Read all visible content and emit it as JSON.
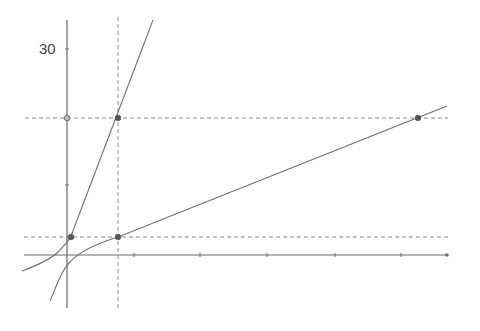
{
  "figure": {
    "y_tick_label": "30",
    "colors": {
      "axis": "#6a6a6a",
      "curve": "#707070",
      "dashed": "#8a8a8a",
      "point": "#555555",
      "open_point_fill": "#bdbdbd"
    },
    "axes": {
      "x_axis": {
        "x1": 24,
        "y": 255,
        "x2": 447
      },
      "y_axis": {
        "x": 67,
        "y1": 20,
        "y2": 308
      },
      "x_ticks_px": [
        134,
        200,
        267,
        335,
        401
      ],
      "y_ticks_px": [
        49,
        118,
        185
      ]
    },
    "dashed_lines": [
      {
        "id": "h-upper",
        "x1": 25,
        "y1": 118,
        "x2": 448,
        "y2": 118
      },
      {
        "id": "h-lower",
        "x1": 24,
        "y1": 237,
        "x2": 448,
        "y2": 237
      },
      {
        "id": "v-dashed",
        "x1": 118,
        "y1": 17,
        "x2": 118,
        "y2": 308
      }
    ],
    "curves": [
      {
        "id": "steep-curve",
        "path": "M22,271 C38,265 52,258 58,252 C64,246 68,242 71,236 L153,20"
      },
      {
        "id": "shallow-curve",
        "path": "M50,301 C58,282 62,270 70,262 C78,253 92,245 118,237 L447,106"
      }
    ],
    "points": [
      {
        "id": "point-steep-upper",
        "x": 118,
        "y": 118,
        "open": false
      },
      {
        "id": "point-y-axis-open",
        "x": 67,
        "y": 118,
        "open": true
      },
      {
        "id": "point-steep-lower",
        "x": 71,
        "y": 237,
        "open": false
      },
      {
        "id": "point-shallow-lower",
        "x": 118,
        "y": 237,
        "open": false
      },
      {
        "id": "point-shallow-right",
        "x": 418,
        "y": 118,
        "open": false
      }
    ]
  }
}
